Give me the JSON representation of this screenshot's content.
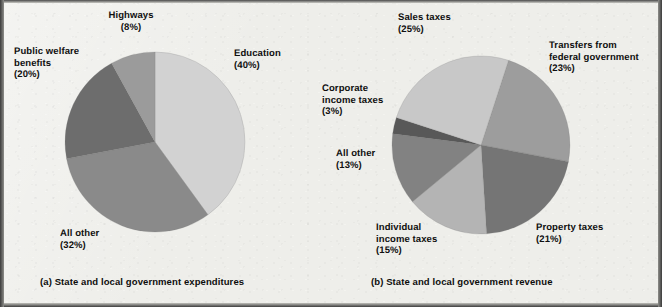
{
  "figure": {
    "background_color": "#eeeeea",
    "captions": {
      "left": "(a) State and local government expenditures",
      "right": "(b) State and local government revenue"
    }
  },
  "chart_data": [
    {
      "type": "pie",
      "id": "state-local-expenditures",
      "title": "(a) State and local government expenditures",
      "legend_position": "outside-labels",
      "labels": [
        "Education",
        "All other",
        "Public welfare benefits",
        "Highways"
      ],
      "values": [
        40,
        32,
        20,
        8
      ],
      "unit": "%",
      "slices": [
        {
          "label": "Education",
          "value": 40,
          "pct_text": "(40%)",
          "color": "#d2d2d2",
          "start_angle": 0,
          "end_angle": 144
        },
        {
          "label": "All other",
          "value": 32,
          "pct_text": "(32%)",
          "color": "#8a8a8a",
          "start_angle": 144,
          "end_angle": 259.2
        },
        {
          "label": "Public welfare benefits",
          "value": 20,
          "pct_text": "(20%)",
          "color": "#6d6d6d",
          "start_angle": 259.2,
          "end_angle": 331.2
        },
        {
          "label": "Highways",
          "value": 8,
          "pct_text": "(8%)",
          "color": "#9b9b9b",
          "start_angle": 331.2,
          "end_angle": 360
        }
      ],
      "annotations": [
        {
          "name": "highways",
          "text": "Highways\n(8%)"
        },
        {
          "name": "education",
          "text": "Education\n(40%)"
        },
        {
          "name": "public-welfare-benefits",
          "text": "Public welfare\nbenefits\n(20%)"
        },
        {
          "name": "all-other",
          "text": "All other\n(32%)"
        }
      ]
    },
    {
      "type": "pie",
      "id": "state-local-revenue",
      "title": "(b) State and local government revenue",
      "legend_position": "outside-labels",
      "labels": [
        "Sales taxes",
        "Transfers from federal government",
        "Property taxes",
        "Individual income taxes",
        "All other",
        "Corporate income taxes"
      ],
      "values": [
        25,
        23,
        21,
        15,
        13,
        3
      ],
      "unit": "%",
      "slices": [
        {
          "label": "Transfers from federal government",
          "value": 23,
          "pct_text": "(23%)",
          "color": "#9d9d9d",
          "start_angle": 18,
          "end_angle": 100.8
        },
        {
          "label": "Property taxes",
          "value": 21,
          "pct_text": "(21%)",
          "color": "#757575",
          "start_angle": 100.8,
          "end_angle": 176.4
        },
        {
          "label": "Individual income taxes",
          "value": 15,
          "pct_text": "(15%)",
          "color": "#b4b4b4",
          "start_angle": 176.4,
          "end_angle": 230.4
        },
        {
          "label": "All other",
          "value": 13,
          "pct_text": "(13%)",
          "color": "#828282",
          "start_angle": 230.4,
          "end_angle": 277.2
        },
        {
          "label": "Corporate income taxes",
          "value": 3,
          "pct_text": "(3%)",
          "color": "#585858",
          "start_angle": 277.2,
          "end_angle": 288
        },
        {
          "label": "Sales taxes",
          "value": 25,
          "pct_text": "(25%)",
          "color": "#c8c8c8",
          "start_angle": 288,
          "end_angle": 378
        }
      ],
      "annotations": [
        {
          "name": "sales-taxes",
          "text": "Sales taxes\n(25%)"
        },
        {
          "name": "transfers-from-federal-government",
          "text": "Transfers from\nfederal government\n(23%)"
        },
        {
          "name": "corporate-income-taxes",
          "text": "Corporate\nincome taxes\n(3%)"
        },
        {
          "name": "all-other",
          "text": "All other\n(13%)"
        },
        {
          "name": "individual-income-taxes",
          "text": "Individual\nincome taxes\n(15%)"
        },
        {
          "name": "property-taxes",
          "text": "Property taxes\n(21%)"
        }
      ]
    }
  ]
}
